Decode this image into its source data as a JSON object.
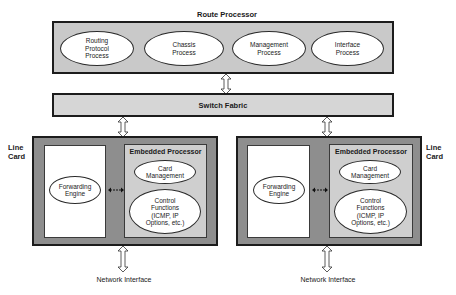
{
  "diagram": {
    "route_processor": {
      "title": "Route Processor",
      "processes": [
        {
          "label": "Routing Protocol Process"
        },
        {
          "label": "Chassis Process"
        },
        {
          "label": "Management Process"
        },
        {
          "label": "Interface Process"
        }
      ]
    },
    "switch_fabric": {
      "label": "Switch Fabric"
    },
    "line_cards": [
      {
        "side_label": "Line Card",
        "forwarding_engine": "Forwarding Engine",
        "embedded_processor": {
          "title": "Embedded Processor",
          "card_management": "Card Management",
          "control_functions": "Control Functions (ICMP, IP Options, etc.)"
        },
        "network_interface": "Network Interface"
      },
      {
        "side_label": "Line Card",
        "forwarding_engine": "Forwarding Engine",
        "embedded_processor": {
          "title": "Embedded Processor",
          "card_management": "Card Management",
          "control_functions": "Control Functions (ICMP, IP Options, etc.)"
        },
        "network_interface": "Network Interface"
      }
    ],
    "colors": {
      "route_processor_fill": "#c9c9c9",
      "switch_fabric_fill": "#d6d6d6",
      "line_card_fill": "#8e8e8e",
      "embedded_processor_fill": "#cfcfcf",
      "forwarding_panel_fill": "#ffffff",
      "ellipse_fill": "#ffffff",
      "border": "#1c1c1c"
    }
  }
}
